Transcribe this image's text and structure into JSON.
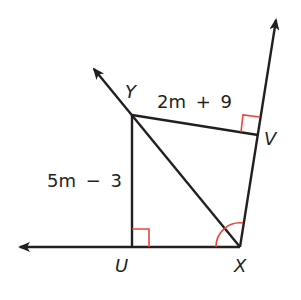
{
  "diagram": {
    "points": {
      "Y": {
        "label": "Y",
        "x": 132,
        "y": 115
      },
      "U": {
        "label": "U",
        "x": 132,
        "y": 247
      },
      "X": {
        "label": "X",
        "x": 240,
        "y": 247
      },
      "V": {
        "label": "V",
        "x": 258,
        "y": 135
      }
    },
    "segments": [
      {
        "from": "Y",
        "to": "U",
        "label": "5m − 3"
      },
      {
        "from": "Y",
        "to": "V",
        "label": "2m + 9"
      },
      {
        "from": "Y",
        "to": "X",
        "label": ""
      }
    ],
    "rays": [
      {
        "from": "X",
        "through": "U",
        "direction": "left"
      },
      {
        "from": "X",
        "through": "Y",
        "direction": "upper-left"
      },
      {
        "from": "X",
        "through": "V",
        "direction": "up"
      }
    ],
    "labels": {
      "yu_length": "5m − 3",
      "yv_length_num": "2m",
      "yv_length_op": "+",
      "yv_length_const": "9",
      "yu_num": "5m",
      "yu_op": "−",
      "yu_const": "3"
    },
    "markers": [
      {
        "type": "right-angle",
        "at": "U"
      },
      {
        "type": "right-angle",
        "at": "V"
      },
      {
        "type": "congruent-angle-arcs",
        "at": "X"
      }
    ],
    "colors": {
      "line": "#231f20",
      "marker": "#e8453c"
    }
  }
}
